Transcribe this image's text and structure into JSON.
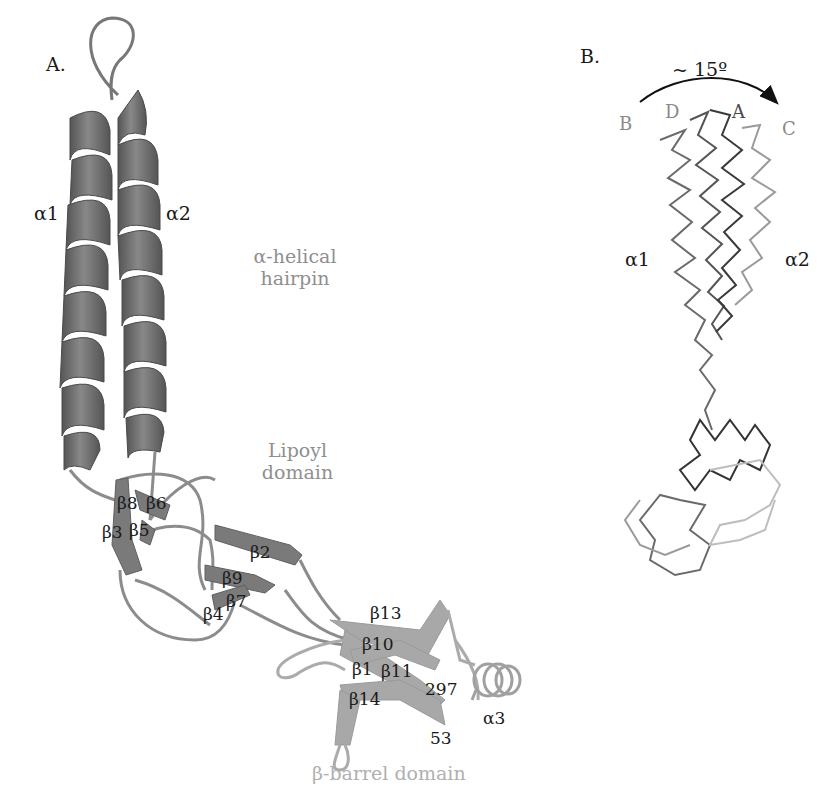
{
  "panel_a": {
    "label": "A.",
    "helix_labels": {
      "alpha1": "α1",
      "alpha2": "α2",
      "alpha3": "α3"
    },
    "domains": {
      "hairpin_line1": "α-helical",
      "hairpin_line2": "hairpin",
      "lipoyl_line1": "Lipoyl",
      "lipoyl_line2": "domain",
      "barrel": "β-barrel domain"
    },
    "strands": {
      "b8": "β8",
      "b6": "β6",
      "b3": "β3",
      "b5": "β5",
      "b2": "β2",
      "b9": "β9",
      "b7": "β7",
      "b4": "β4",
      "b13": "β13",
      "b10": "β10",
      "b1": "β1",
      "b11": "β11",
      "b14": "β14"
    },
    "residues": {
      "c_term": "297",
      "n_term": "53"
    },
    "colors": {
      "helix": "#6a6a6a",
      "lipoyl": "#8a8a8a",
      "barrel": "#a8a8a8"
    }
  },
  "panel_b": {
    "label": "B.",
    "rotation": "~ 15º",
    "chains": {
      "b": "B",
      "d": "D",
      "a": "A",
      "c": "C"
    },
    "helix_labels": {
      "alpha1": "α1",
      "alpha2": "α2"
    }
  }
}
